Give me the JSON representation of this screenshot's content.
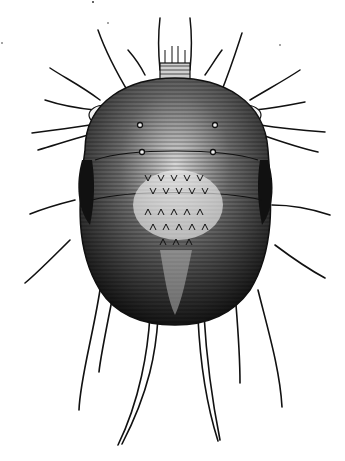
{
  "image": {
    "subject": "engraved illustration of a mite",
    "style": "black-and-white engraving",
    "colors": {
      "background": "#ffffff",
      "ink": "#111111",
      "mid": "#4a4a4a",
      "highlight": "#e8e8e8"
    }
  }
}
